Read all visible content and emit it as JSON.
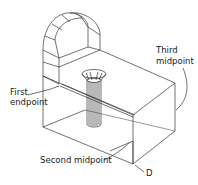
{
  "diagram": {
    "type": "isometric-3d-model",
    "labels": {
      "first_endpoint_line1": "First",
      "first_endpoint_line2": "endpoint",
      "third_midpoint_line1": "Third",
      "third_midpoint_line2": "midpoint",
      "second_midpoint": "Second midpoint",
      "point_d": "D"
    },
    "colors": {
      "line": "#333333",
      "background": "#ffffff",
      "text": "#222222"
    }
  }
}
